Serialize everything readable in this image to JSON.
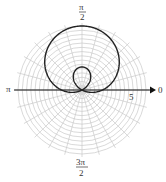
{
  "chart_data": {
    "type": "line",
    "subtype": "polar",
    "title": "",
    "equation_form": "r = a + b sin(theta), limacon with inner loop",
    "a": 2,
    "b": 4.25,
    "angle_labels": {
      "zero": "0",
      "half_pi": "π/2",
      "pi": "π",
      "three_half_pi": "3π/2"
    },
    "radial_tick_label": "5",
    "grid": true,
    "rings": 15,
    "spokes": 24
  },
  "labels": {
    "zero": "0",
    "pi": "π",
    "half_pi_num": "π",
    "half_pi_den": "2",
    "three_half_pi_num": "3π",
    "three_half_pi_den": "2",
    "radial": "5"
  },
  "colors": {
    "grid": "#c8c8c8",
    "curve": "#222222",
    "axis": "#111111"
  }
}
